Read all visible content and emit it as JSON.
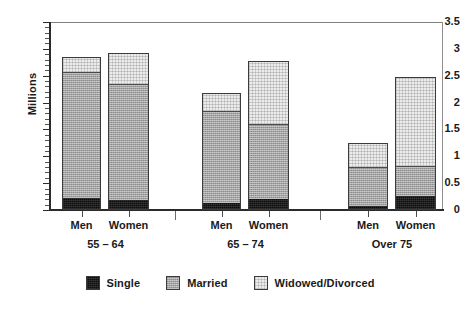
{
  "chart_data": {
    "type": "bar",
    "subtype": "stacked",
    "title": "",
    "xlabel": "",
    "ylabel": "Millions",
    "ylim": [
      0,
      3.5
    ],
    "ytick_labels": [
      "0",
      "0.5",
      "1",
      "1.5",
      "2",
      "2.5",
      "3",
      "3.5"
    ],
    "ytick_values": [
      0,
      0.5,
      1,
      1.5,
      2,
      2.5,
      3,
      3.5
    ],
    "yminor_step": 0.1,
    "grid": false,
    "legend_position": "bottom",
    "categories": [
      "Men",
      "Women",
      "Men",
      "Women",
      "Men",
      "Women"
    ],
    "groups": [
      {
        "label": "55 – 64",
        "categories": [
          "Men",
          "Women"
        ]
      },
      {
        "label": "65 – 74",
        "categories": [
          "Men",
          "Women"
        ]
      },
      {
        "label": "Over 75",
        "categories": [
          "Men",
          "Women"
        ]
      }
    ],
    "series": [
      {
        "name": "Single",
        "color": "#0d0d0d",
        "values": [
          0.25,
          0.21,
          0.14,
          0.22,
          0.1,
          0.27
        ]
      },
      {
        "name": "Married",
        "color": "#a3a3a3",
        "values": [
          2.33,
          2.15,
          1.73,
          1.4,
          0.72,
          0.56
        ]
      },
      {
        "name": "Widowed/Divorced",
        "color": "#ececec",
        "values": [
          0.27,
          0.57,
          0.31,
          1.15,
          0.43,
          1.65
        ]
      }
    ],
    "bar_totals": [
      2.85,
      2.93,
      2.18,
      2.77,
      1.25,
      2.48
    ],
    "annotations": []
  },
  "legend": {
    "items": [
      {
        "label": "Single"
      },
      {
        "label": "Married"
      },
      {
        "label": "Widowed/Divorced"
      }
    ]
  }
}
